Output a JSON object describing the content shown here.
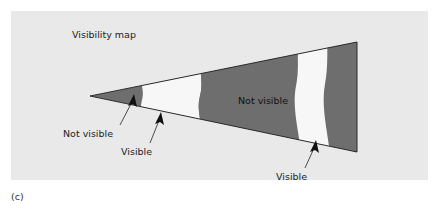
{
  "figure": {
    "caption": "(c)",
    "title": "Visibility map",
    "colors": {
      "panel_background": "#e9e9e9",
      "not_visible_fill": "#6e6e6e",
      "visible_fill": "#f7f7f7",
      "outline": "#2b2b2b",
      "text": "#222222",
      "page_background": "#ffffff"
    },
    "annotations": [
      {
        "id": "not-visible-left",
        "label": "Not visible",
        "text_x": 63,
        "text_y": 133,
        "leader_from_x": 120,
        "leader_from_y": 125,
        "leader_to_x": 133,
        "leader_to_y": 98,
        "arrow_angle_deg": -64
      },
      {
        "id": "visible-left",
        "label": "Visible",
        "text_x": 121,
        "text_y": 151,
        "leader_from_x": 150,
        "leader_from_y": 142,
        "leader_to_x": 160,
        "leader_to_y": 115,
        "arrow_angle_deg": -70
      },
      {
        "id": "not-visible-right",
        "label": "Not visible",
        "text_x": 238,
        "text_y": 101,
        "inside_shape": true
      },
      {
        "id": "visible-right",
        "label": "Visible",
        "text_x": 276,
        "text_y": 176,
        "leader_from_x": 305,
        "leader_from_y": 167,
        "leader_to_x": 314,
        "leader_to_y": 143,
        "arrow_angle_deg": -70
      }
    ],
    "wedge": {
      "apex_x": 90,
      "apex_y": 96,
      "right_x": 357,
      "right_top_y": 42,
      "right_bottom_y": 152,
      "bands": [
        {
          "kind": "not-visible",
          "order": 1
        },
        {
          "kind": "visible",
          "order": 2
        },
        {
          "kind": "not-visible",
          "order": 3
        },
        {
          "kind": "visible",
          "order": 4
        },
        {
          "kind": "not-visible",
          "order": 5
        }
      ]
    }
  }
}
